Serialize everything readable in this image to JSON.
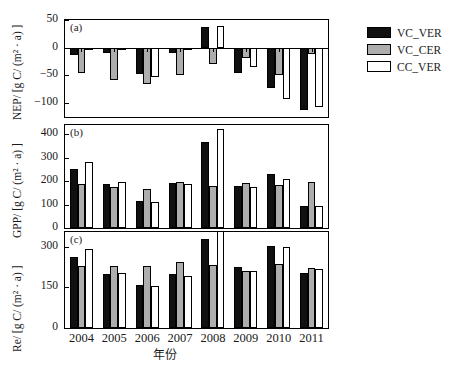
{
  "chart_data": {
    "type": "bar",
    "title": "",
    "xlabel": "年份",
    "categories": [
      "2004",
      "2005",
      "2006",
      "2007",
      "2008",
      "2009",
      "2010",
      "2011"
    ],
    "legend": [
      "VC_VER",
      "VC_CER",
      "CC_VER"
    ],
    "legend_position": "top-right-outside",
    "grid": false,
    "panels": [
      {
        "tag": "(a)",
        "ylabel": "NEP/ [g C/ (m² · a) ]",
        "ylim": [
          -125,
          50
        ],
        "yticks": [
          50,
          0,
          -50,
          -100
        ],
        "ytick_labels": [
          "50",
          "0",
          "−50",
          "−100"
        ],
        "series": [
          {
            "name": "VC_VER",
            "values": [
              -13,
              -10,
              -47,
              -10,
              38,
              -45,
              -72,
              -112
            ]
          },
          {
            "name": "VC_CER",
            "values": [
              -45,
              -58,
              -66,
              -49,
              -30,
              -18,
              -50,
              -12
            ]
          },
          {
            "name": "CC_VER",
            "values": [
              -3,
              -5,
              -52,
              -5,
              40,
              -34,
              -92,
              -107
            ]
          }
        ]
      },
      {
        "tag": "(b)",
        "ylabel": "GPP/ [g C/ (m² · a) ]",
        "ylim": [
          0,
          440
        ],
        "yticks": [
          400,
          300,
          200,
          100,
          0
        ],
        "ytick_labels": [
          "400",
          "300",
          "200",
          "100",
          "0"
        ],
        "series": [
          {
            "name": "VC_VER",
            "values": [
              250,
              190,
              117,
              194,
              368,
              180,
              230,
              95
            ]
          },
          {
            "name": "VC_CER",
            "values": [
              187,
              176,
              166,
              198,
              178,
              192,
              182,
              196
            ]
          },
          {
            "name": "CC_VER",
            "values": [
              284,
              197,
              112,
              186,
              425,
              175,
              208,
              93
            ]
          }
        ]
      },
      {
        "tag": "(c)",
        "ylabel": "Re/ [g C/ (m² · a) ]",
        "ylim": [
          0,
          355
        ],
        "yticks": [
          300,
          150,
          0
        ],
        "ytick_labels": [
          "300",
          "150",
          "0"
        ],
        "series": [
          {
            "name": "VC_VER",
            "values": [
              263,
              198,
              158,
              199,
              330,
              225,
              302,
              205
            ]
          },
          {
            "name": "VC_CER",
            "values": [
              228,
              231,
              228,
              243,
              232,
              210,
              235,
              222
            ]
          },
          {
            "name": "CC_VER",
            "values": [
              291,
              203,
              157,
              192,
              385,
              209,
              300,
              219
            ]
          }
        ]
      }
    ],
    "colors": {
      "VC_VER": "#101010",
      "VC_CER": "#adadad",
      "CC_VER": "#ffffff",
      "axis": "#000000"
    }
  },
  "caption": {
    "text": ""
  }
}
